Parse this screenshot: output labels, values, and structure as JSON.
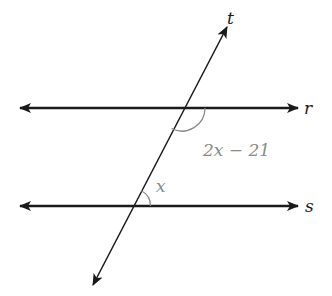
{
  "diagram": {
    "type": "parallel-lines-transversal",
    "lines": {
      "r": {
        "label": "r",
        "y": 108,
        "x1": 20,
        "x2": 298
      },
      "s": {
        "label": "s",
        "y": 206,
        "x1": 20,
        "x2": 298
      },
      "t": {
        "label": "t",
        "x1": 93,
        "y1": 285,
        "x2": 227,
        "y2": 27
      }
    },
    "angles": {
      "upper": {
        "label": "2x − 21",
        "at_line": "r",
        "position": "below r, right of t"
      },
      "lower": {
        "label": "x",
        "at_line": "s",
        "position": "above s, right of t"
      }
    },
    "colors": {
      "line": "#1a1a1a",
      "angle_arc": "#8a8a8a",
      "angle_label": "#8a8a8a"
    }
  }
}
